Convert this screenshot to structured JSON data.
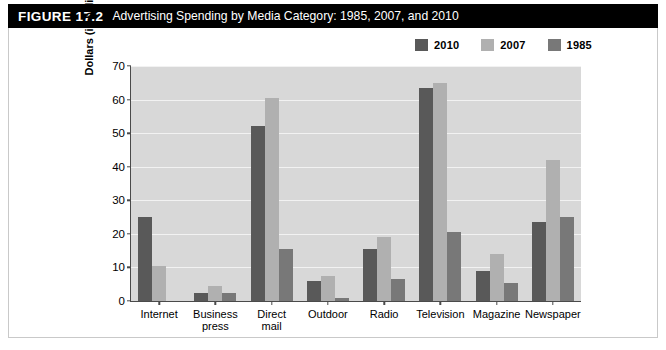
{
  "figure": {
    "number": "FIGURE 17.2",
    "title": "Advertising Spending by Media Category: 1985, 2007, and 2010"
  },
  "colors": {
    "series_2010": "#595959",
    "series_2007": "#b0b0b0",
    "series_1985": "#787878",
    "plot_background": "#d8d8d8",
    "gridline": "#f2f2f2",
    "axis": "#4a4a4a",
    "title_bar_background": "#000000",
    "title_bar_text": "#ffffff"
  },
  "chart_data": {
    "type": "bar",
    "title": "Advertising Spending by Media Category: 1985, 2007, and 2010",
    "xlabel": "",
    "ylabel": "Dollars (in billions)",
    "ylim": [
      0,
      70
    ],
    "ytick_labels": [
      "0",
      "10",
      "20",
      "30",
      "40",
      "50",
      "60",
      "70"
    ],
    "yticks": [
      0,
      10,
      20,
      30,
      40,
      50,
      60,
      70
    ],
    "grid": true,
    "legend_position": "top-right",
    "categories": [
      "Internet",
      "Business press",
      "Direct mail",
      "Outdoor",
      "Radio",
      "Television",
      "Magazine",
      "Newspaper"
    ],
    "category_lines": [
      [
        "Internet"
      ],
      [
        "Business",
        "press"
      ],
      [
        "Direct",
        "mail"
      ],
      [
        "Outdoor"
      ],
      [
        "Radio"
      ],
      [
        "Television"
      ],
      [
        "Magazine"
      ],
      [
        "Newspaper"
      ]
    ],
    "series": [
      {
        "name": "2010",
        "color": "#595959",
        "values": [
          25,
          2.5,
          52,
          6,
          15.5,
          63.5,
          9,
          23.5
        ]
      },
      {
        "name": "2007",
        "color": "#b0b0b0",
        "values": [
          10.5,
          4.5,
          60.5,
          7.5,
          19,
          65,
          14,
          42
        ]
      },
      {
        "name": "1985",
        "color": "#787878",
        "values": [
          0,
          2.5,
          15.5,
          1,
          6.5,
          20.5,
          5.5,
          25
        ]
      }
    ]
  }
}
